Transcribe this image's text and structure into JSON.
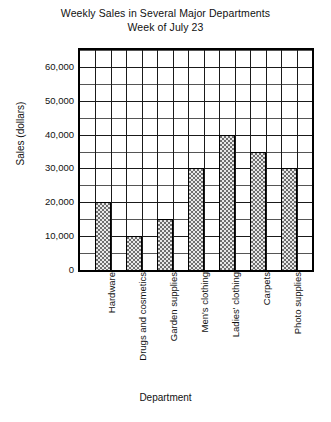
{
  "chart_data": {
    "type": "bar",
    "title": "Weekly Sales in Several Major Departments",
    "subtitle": "Week of July 23",
    "xlabel": "Department",
    "ylabel": "Sales (dollars)",
    "categories": [
      "Hardware",
      "Drugs and cosmetics",
      "Garden supplies",
      "Men's clothing",
      "Ladies' clothing",
      "Carpets",
      "Photo supplies"
    ],
    "values": [
      20000,
      10000,
      15000,
      30000,
      40000,
      35000,
      30000
    ],
    "ylim": [
      0,
      65000
    ],
    "ytick_values": [
      0,
      10000,
      20000,
      30000,
      40000,
      50000,
      60000
    ],
    "ytick_labels": [
      "0",
      "10,000",
      "20,000",
      "30,000",
      "40,000",
      "50,000",
      "60,000"
    ],
    "y_minor_step": 5000,
    "grid": true,
    "grid_columns": 15,
    "legend": null,
    "bar_fill": "#e8e8e8",
    "bar_edge": "#000000",
    "grid_color": "#555555",
    "axis_color": "#000000"
  }
}
